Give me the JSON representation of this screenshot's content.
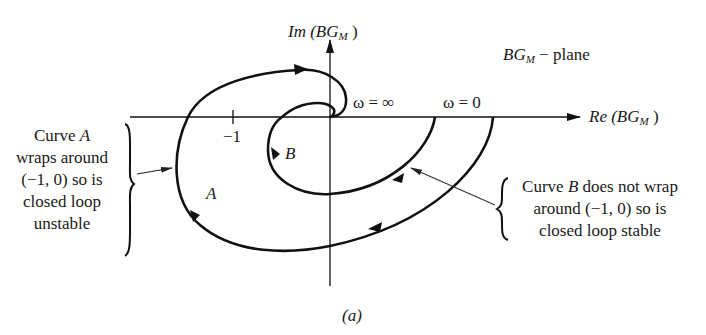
{
  "diagram": {
    "type": "nyquist-plot",
    "plane_label": {
      "prefix": "BG",
      "subscript": "M",
      "suffix": " − plane"
    },
    "axes": {
      "imag": {
        "prefix": "Im (",
        "var": "BG",
        "subscript": "M",
        "suffix": " )"
      },
      "real": {
        "prefix": "Re (",
        "var": "BG",
        "subscript": "M",
        "suffix": " )"
      }
    },
    "tick_minus_one": "−1",
    "omega_inf_label": "ω = ∞",
    "omega_zero_label": "ω = 0",
    "curve_a_label": "A",
    "curve_b_label": "B",
    "note_a": {
      "line1_prefix": "Curve ",
      "line1_var": "A",
      "line2": "wraps around",
      "line3": "(−1, 0) so is",
      "line4": "closed loop",
      "line5": "unstable"
    },
    "note_b": {
      "line1_prefix": "Curve ",
      "line1_var": "B",
      "line1_suffix": " does not wrap",
      "line2": "around (−1, 0) so is",
      "line3": "closed loop stable"
    },
    "caption": "(a)",
    "colors": {
      "ink": "#111111",
      "background": "#ffffff",
      "pointer": "#333333"
    }
  }
}
